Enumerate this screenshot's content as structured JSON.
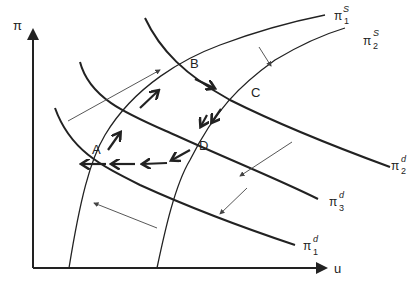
{
  "axes": {
    "y_label": "π",
    "x_label": "u"
  },
  "curves": {
    "supply": [
      {
        "name": "π",
        "sup": "S",
        "sub": "1"
      },
      {
        "name": "π",
        "sup": "S",
        "sub": "2"
      }
    ],
    "demand": [
      {
        "name": "π",
        "sup": "d",
        "sub": "2"
      },
      {
        "name": "π",
        "sup": "d",
        "sub": "3"
      },
      {
        "name": "π",
        "sup": "d",
        "sub": "1"
      }
    ]
  },
  "points": [
    "A",
    "B",
    "C",
    "D"
  ],
  "colors": {
    "line": "#222222",
    "thin": "#444444",
    "background": "#ffffff"
  }
}
